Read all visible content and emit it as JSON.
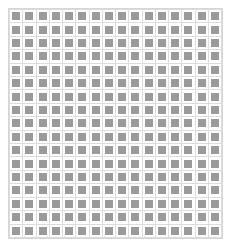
{
  "figure": {
    "kind": "grid-pattern",
    "width_px": 231,
    "height_px": 247
  },
  "grid": {
    "columns": 16,
    "rows": 17,
    "left_px": 8,
    "top_px": 8,
    "width_px": 215,
    "height_px": 231,
    "cell_pitch_x_px": 13.4,
    "cell_pitch_y_px": 13.6,
    "inner_square_ratio": 0.6,
    "panel_background": "#ffffff",
    "panel_border_color": "#d6d6d6",
    "panel_border_width_px": 1,
    "gridline_color": "#dcdcdc",
    "gridline_width_px": 1,
    "cell_background": "#ffffff",
    "tile_color": "#9a9a9a"
  }
}
